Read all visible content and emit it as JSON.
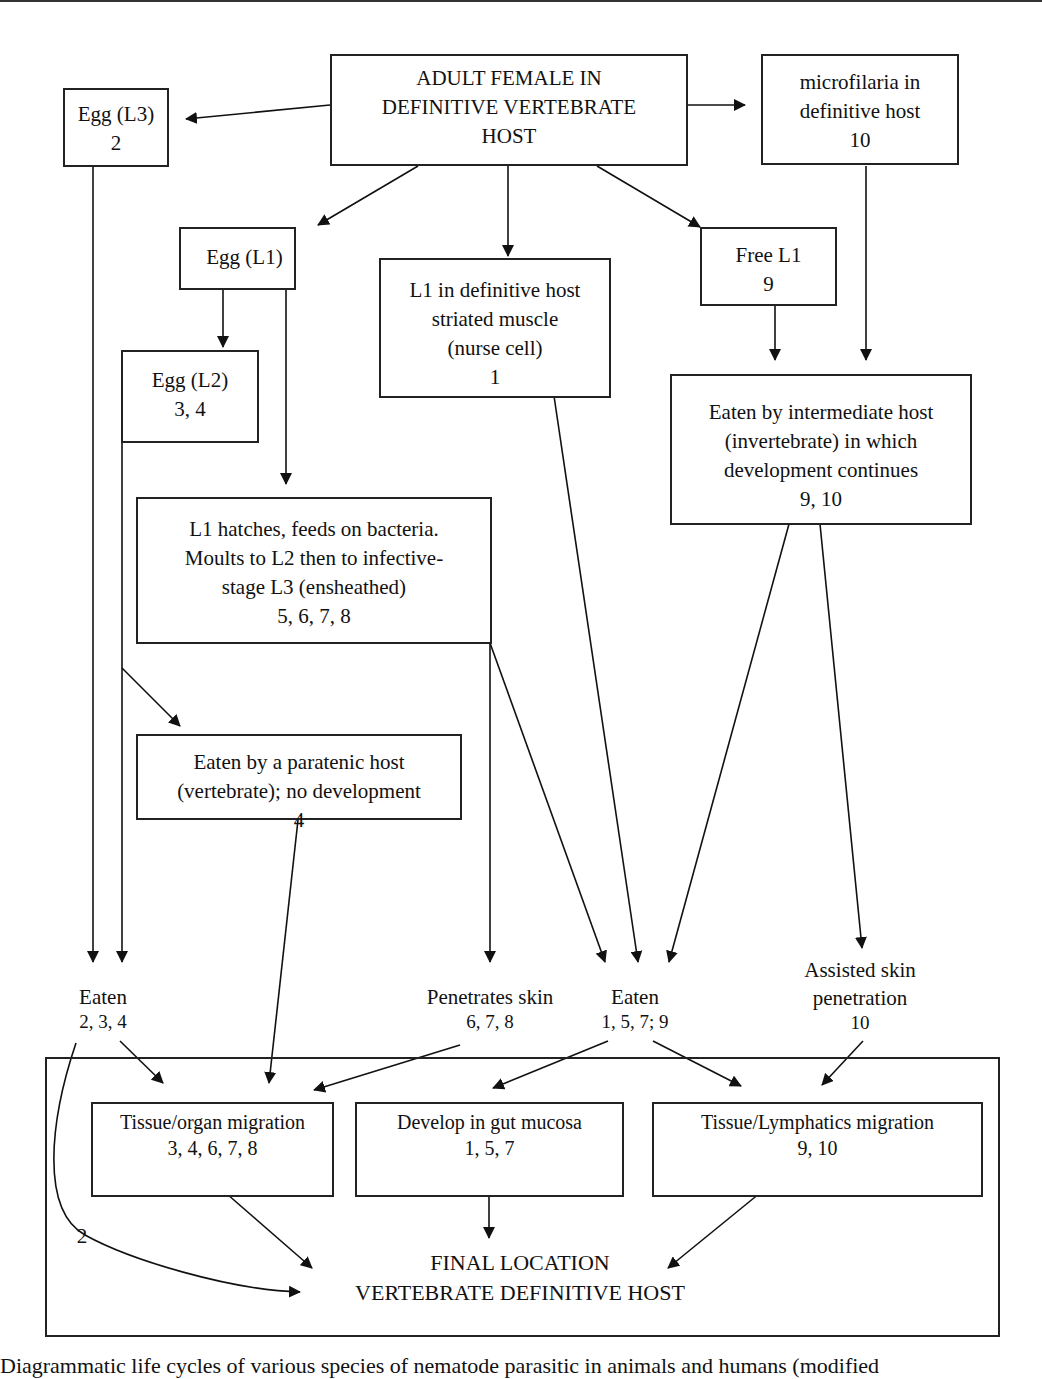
{
  "diagram": {
    "nodes": {
      "adult_female": {
        "lines": [
          "ADULT FEMALE IN",
          "DEFINITIVE VERTEBRATE",
          "HOST"
        ]
      },
      "egg_l3": {
        "lines": [
          "Egg (L3)",
          "2"
        ]
      },
      "microfilaria": {
        "lines": [
          "microfilaria in",
          "definitive host",
          "10"
        ]
      },
      "egg_l1": {
        "lines": [
          "Egg (L1)"
        ]
      },
      "l1_muscle": {
        "lines": [
          "L1 in definitive host",
          "striated muscle",
          "(nurse cell)",
          "1"
        ]
      },
      "free_l1": {
        "lines": [
          "Free L1",
          "9"
        ]
      },
      "egg_l2": {
        "lines": [
          "Egg (L2)",
          "3, 4"
        ]
      },
      "intermediate_host": {
        "lines": [
          "Eaten by intermediate host",
          "(invertebrate) in which",
          "development continues",
          "9, 10"
        ]
      },
      "l1_hatches": {
        "lines": [
          "L1 hatches, feeds on bacteria.",
          "Moults to L2 then to infective-",
          "stage L3  (ensheathed)",
          "5, 6, 7, 8"
        ]
      },
      "paratenic_host": {
        "lines": [
          "Eaten by a  paratenic host",
          "(vertebrate); no development",
          "4"
        ]
      },
      "eaten_left": {
        "lines": [
          "Eaten",
          "2,  3, 4"
        ]
      },
      "penetrates_skin": {
        "lines": [
          "Penetrates skin",
          "6, 7, 8"
        ]
      },
      "eaten_mid": {
        "lines": [
          "Eaten",
          "1, 5, 7;  9"
        ]
      },
      "assisted_skin": {
        "lines": [
          "Assisted skin",
          "penetration",
          "10"
        ]
      },
      "tissue_organ": {
        "lines": [
          "Tissue/organ migration",
          "3, 4, 6, 7, 8"
        ]
      },
      "gut_mucosa": {
        "lines": [
          "Develop in gut mucosa",
          "1, 5, 7"
        ]
      },
      "tissue_lymphatics": {
        "lines": [
          "Tissue/Lymphatics migration",
          "9, 10"
        ]
      },
      "final_location": {
        "lines": [
          "FINAL LOCATION",
          "VERTEBRATE DEFINITIVE HOST"
        ]
      }
    },
    "edge_labels": {
      "egg_l3_direct": "2"
    },
    "caption": "Diagrammatic life cycles of various species of nematode parasitic in animals and humans (modified"
  }
}
